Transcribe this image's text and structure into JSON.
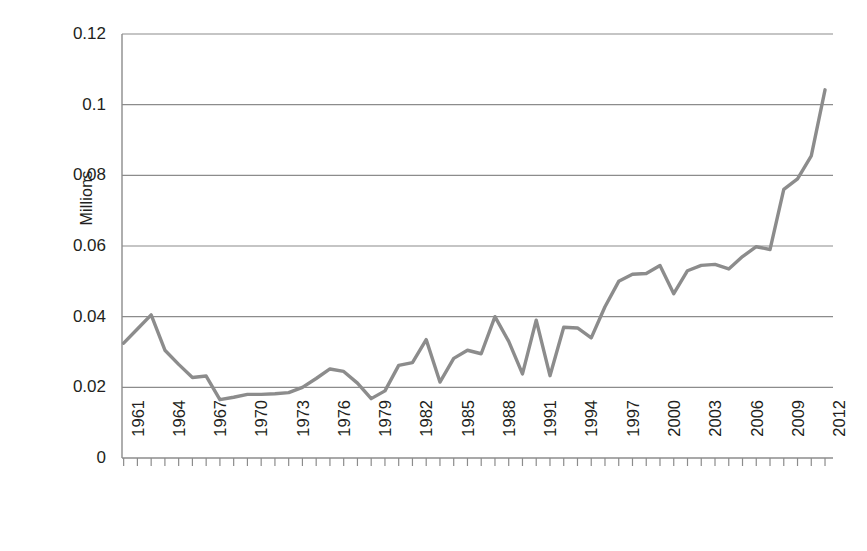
{
  "chart_data": {
    "type": "line",
    "title": "",
    "xlabel": "",
    "ylabel": "Millions",
    "ylim": [
      0,
      0.12
    ],
    "ytick_labels": [
      "0.12",
      "0.1",
      "0.08",
      "0.06",
      "0.04",
      "0.02",
      "0"
    ],
    "ytick_values": [
      0.12,
      0.1,
      0.08,
      0.06,
      0.04,
      0.02,
      0
    ],
    "grid": "horizontal",
    "legend": "none",
    "line_color": "#8c8c8c",
    "axis_color": "#8c8c8c",
    "gridline_color": "#8c8c8c",
    "text_color": "#231f20",
    "xtick_labels": [
      "1961",
      "1964",
      "1967",
      "1970",
      "1973",
      "1976",
      "1979",
      "1982",
      "1985",
      "1988",
      "1991",
      "1994",
      "1997",
      "2000",
      "2003",
      "2006",
      "2009",
      "2012"
    ],
    "x": [
      1961,
      1962,
      1963,
      1964,
      1965,
      1966,
      1967,
      1968,
      1969,
      1970,
      1971,
      1972,
      1973,
      1974,
      1975,
      1976,
      1977,
      1978,
      1979,
      1980,
      1981,
      1982,
      1983,
      1984,
      1985,
      1986,
      1987,
      1988,
      1989,
      1990,
      1991,
      1992,
      1993,
      1994,
      1995,
      1996,
      1997,
      1998,
      1999,
      2000,
      2001,
      2002,
      2003,
      2004,
      2005,
      2006,
      2007,
      2008,
      2009,
      2010,
      2011,
      2012
    ],
    "values": [
      0.0325,
      0.0365,
      0.0405,
      0.0305,
      0.0265,
      0.0228,
      0.0232,
      0.0165,
      0.0172,
      0.018,
      0.018,
      0.0182,
      0.0185,
      0.02,
      0.0225,
      0.0252,
      0.0245,
      0.0212,
      0.0168,
      0.019,
      0.0262,
      0.027,
      0.0335,
      0.0215,
      0.0282,
      0.0305,
      0.0295,
      0.04,
      0.033,
      0.0238,
      0.039,
      0.0233,
      0.037,
      0.0368,
      0.034,
      0.0428,
      0.05,
      0.052,
      0.0522,
      0.0545,
      0.0465,
      0.053,
      0.0545,
      0.0548,
      0.0535,
      0.057,
      0.0598,
      0.059,
      0.076,
      0.079,
      0.0855,
      0.1042
    ]
  }
}
